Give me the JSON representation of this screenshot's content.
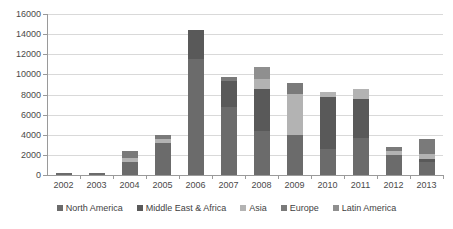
{
  "chart_data": {
    "type": "bar",
    "stacked": true,
    "title": "",
    "xlabel": "",
    "ylabel": "",
    "ylim": [
      0,
      16000
    ],
    "ytick_step": 2000,
    "ytick_labels": [
      "0",
      "2000",
      "4000",
      "6000",
      "8000",
      "10000",
      "12000",
      "14000",
      "16000"
    ],
    "grid": true,
    "legend_position": "bottom",
    "categories": [
      "2002",
      "2003",
      "2004",
      "2005",
      "2006",
      "2007",
      "2008",
      "2009",
      "2010",
      "2011",
      "2012",
      "2013"
    ],
    "series": [
      {
        "name": "North America",
        "color": "#6b6b6b",
        "values": [
          200,
          190,
          1300,
          3200,
          11500,
          6750,
          4400,
          4000,
          2600,
          3700,
          1950,
          1300
        ]
      },
      {
        "name": "Middle East & Africa",
        "color": "#595959",
        "values": [
          0,
          0,
          0,
          0,
          2950,
          2550,
          4100,
          0,
          5200,
          3850,
          0,
          300
        ]
      },
      {
        "name": "Asia",
        "color": "#b3b3b3",
        "values": [
          0,
          0,
          400,
          420,
          0,
          0,
          1000,
          4050,
          450,
          950,
          450,
          500
        ]
      },
      {
        "name": "Europe",
        "color": "#7a7a7a",
        "values": [
          0,
          0,
          700,
          400,
          0,
          450,
          0,
          1050,
          0,
          0,
          350,
          1450
        ]
      },
      {
        "name": "Latin America",
        "color": "#8f8f8f",
        "values": [
          0,
          0,
          0,
          0,
          0,
          0,
          1200,
          0,
          0,
          0,
          0,
          0
        ]
      }
    ],
    "totals": [
      200,
      190,
      2400,
      4020,
      14450,
      9750,
      10700,
      9100,
      8250,
      8500,
      2750,
      3550
    ]
  },
  "legend": {
    "items": [
      {
        "label": "North America"
      },
      {
        "label": "Middle East & Africa"
      },
      {
        "label": "Asia"
      },
      {
        "label": "Europe"
      },
      {
        "label": "Latin America"
      }
    ]
  },
  "colors": {
    "gridline": "#d9d9d9",
    "axis": "#9a9a9a",
    "tick_text": "#4a4a4a",
    "legend_text": "#3f3f3f",
    "background": "#ffffff"
  }
}
